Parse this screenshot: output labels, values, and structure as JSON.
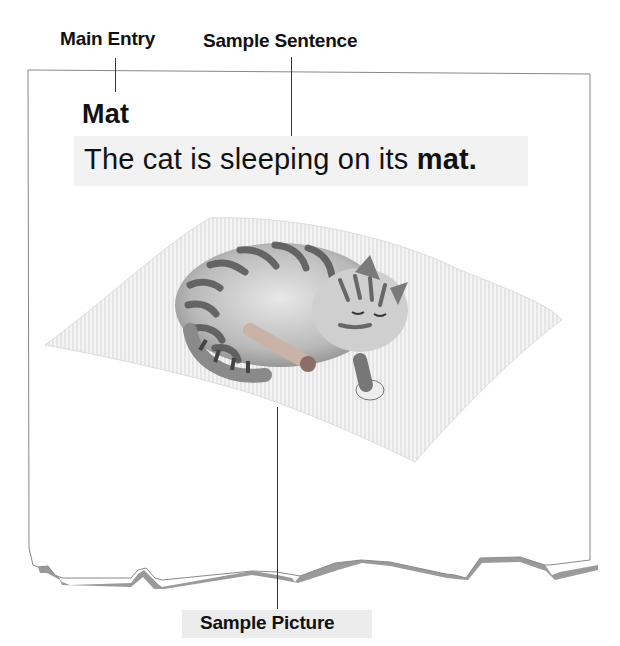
{
  "callouts": {
    "main_entry": "Main Entry",
    "sample_sentence": "Sample Sentence",
    "sample_picture": "Sample Picture"
  },
  "entry": {
    "headword": "Mat",
    "sentence_prefix": "The cat is sleeping on its ",
    "sentence_emphasis": "mat."
  },
  "picture": {
    "subject": "sleeping tabby cat curled up on a mat",
    "icon": "cat-on-mat-illustration"
  },
  "colors": {
    "page_border": "#888888",
    "page_shadow": "#9a9a9a",
    "sentence_band": "#f2f2f2",
    "label_band": "#ececec",
    "text": "#111111"
  }
}
